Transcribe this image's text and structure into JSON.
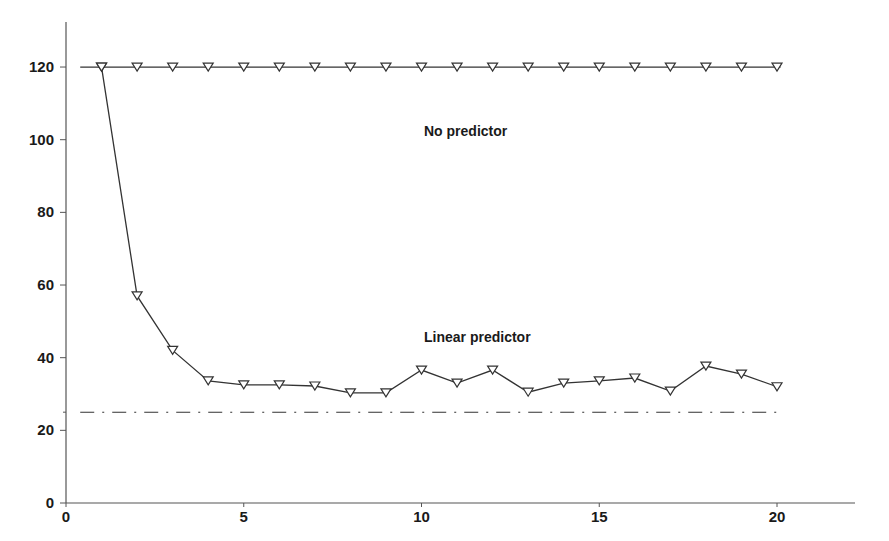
{
  "chart_data": {
    "type": "line",
    "title": "",
    "xlabel": "",
    "ylabel": "",
    "xlim": [
      0,
      22.5
    ],
    "ylim": [
      0,
      130
    ],
    "x_ticks": [
      0,
      5,
      10,
      15,
      20
    ],
    "y_ticks": [
      0,
      20,
      40,
      60,
      80,
      100,
      120
    ],
    "x_tick_labels": [
      "0",
      "5",
      "10",
      "15",
      "20"
    ],
    "y_tick_labels": [
      "0",
      "20",
      "40",
      "60",
      "80",
      "100",
      "120"
    ],
    "grid": false,
    "legend": null,
    "x": [
      1,
      2,
      3,
      4,
      5,
      6,
      7,
      8,
      9,
      10,
      11,
      12,
      13,
      14,
      15,
      16,
      17,
      18,
      19,
      20
    ],
    "series": [
      {
        "name": "No predictor",
        "marker": "triangle-down",
        "style": "solid",
        "values": [
          120,
          120,
          120,
          120,
          120,
          120,
          120,
          120,
          120,
          120,
          120,
          120,
          120,
          120,
          120,
          120,
          120,
          120,
          120,
          120
        ]
      },
      {
        "name": "Linear predictor",
        "marker": "triangle-down",
        "style": "solid",
        "values": [
          120,
          57,
          42,
          33.6,
          32.5,
          32.5,
          32.2,
          30.3,
          30.3,
          36.6,
          33,
          36.6,
          30.5,
          33,
          33.6,
          34.4,
          30.8,
          37.7,
          35.5,
          32
        ]
      },
      {
        "name": "Reference level",
        "marker": "none",
        "style": "dash-dot",
        "values": [
          25,
          25,
          25,
          25,
          25,
          25,
          25,
          25,
          25,
          25,
          25,
          25,
          25,
          25,
          25,
          25,
          25,
          25,
          25,
          25
        ]
      }
    ],
    "annotations": [
      {
        "text": "No predictor",
        "x": 10.3,
        "y": 114
      },
      {
        "text": "Linear predictor",
        "x": 10.3,
        "y": 44
      }
    ]
  },
  "labels": {
    "no_predictor": "No predictor",
    "linear_predictor": "Linear predictor"
  },
  "colors": {
    "line": "#333333",
    "axis": "#555555",
    "text": "#1a1a1a"
  }
}
